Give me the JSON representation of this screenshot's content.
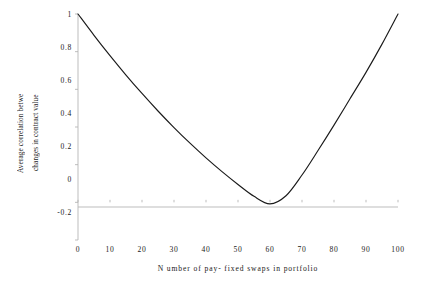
{
  "chart_data": {
    "type": "line",
    "title": "",
    "xlabel": "N umber of pay- fixed swaps in portfolio",
    "ylabel_line1": "Average correlation betwe",
    "ylabel_line2": "changes in contract value",
    "xlim": [
      0,
      100
    ],
    "ylim": [
      -0.2,
      1.0
    ],
    "xticks": [
      0,
      10,
      20,
      30,
      40,
      50,
      60,
      70,
      80,
      90,
      100
    ],
    "xtick_labels": [
      "0",
      "10",
      "20",
      "30",
      "40",
      "50",
      "60",
      "70",
      "80",
      "90",
      "100"
    ],
    "yticks": [
      -0.2,
      0,
      0.2,
      0.4,
      0.6,
      0.8,
      1
    ],
    "ytick_labels": [
      "-0.2",
      "0",
      "0.2",
      "0.4",
      "0.6",
      "0.8",
      "1"
    ],
    "grid": false,
    "legend": "none",
    "line_color": "#1a1a1a",
    "axis_color": "#b5b5b5",
    "series": [
      {
        "name": "Average correlation between changes in contract value",
        "x": [
          0,
          5,
          10,
          15,
          20,
          25,
          30,
          35,
          40,
          45,
          50,
          55,
          60,
          65,
          70,
          75,
          80,
          85,
          90,
          95,
          100
        ],
        "y": [
          1.0,
          0.887,
          0.779,
          0.676,
          0.578,
          0.485,
          0.397,
          0.314,
          0.236,
          0.163,
          0.095,
          0.032,
          -0.008,
          0.035,
          0.145,
          0.275,
          0.41,
          0.55,
          0.69,
          0.84,
          1.0
        ]
      }
    ]
  },
  "axes": {
    "y_title_line1": "Average correlation betwe",
    "y_title_line2": "changes in contract value",
    "x_title": "N umber of pay- fixed swaps in portfolio"
  }
}
